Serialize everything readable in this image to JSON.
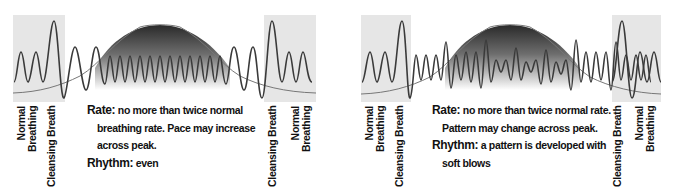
{
  "diagrams": [
    {
      "id": "left",
      "labels": {
        "left_normal_line1": "Normal",
        "left_normal_line2": "Breathing",
        "left_cleansing": "Cleansing Breath",
        "right_cleansing": "Cleansing Breath",
        "right_normal_line1": "Normal",
        "right_normal_line2": "Breathing"
      },
      "description": {
        "rate_key": "Rate:",
        "rate_line1": "no more than twice normal",
        "rate_line2": "breathing rate. Pace may increase",
        "rate_line3": "across peak.",
        "rhythm_key": "Rhythm:",
        "rhythm_value": "even"
      },
      "pattern": "even"
    },
    {
      "id": "right",
      "labels": {
        "left_normal_line1": "Normal",
        "left_normal_line2": "Breathing",
        "left_cleansing": "Cleansing Breath",
        "right_cleansing": "Cleansing Breath",
        "right_normal_line1": "Normal",
        "right_normal_line2": "Breathing"
      },
      "description": {
        "rate_key": "Rate:",
        "rate_line1": "no more than twice normal rate.",
        "rate_line2": "Pattern may change across peak.",
        "rhythm_key": "Rhythm:",
        "rhythm_line1": "a pattern is developed with",
        "rhythm_line2": "soft blows"
      },
      "pattern": "varied with soft blows"
    }
  ],
  "colors": {
    "gray_box": "#e6e6e6",
    "wave_stroke": "#3a3a3a",
    "bell_dark": "#2a2a2a",
    "bell_light": "#ffffff",
    "contraction_curve": "#777777",
    "text": "#111111"
  }
}
